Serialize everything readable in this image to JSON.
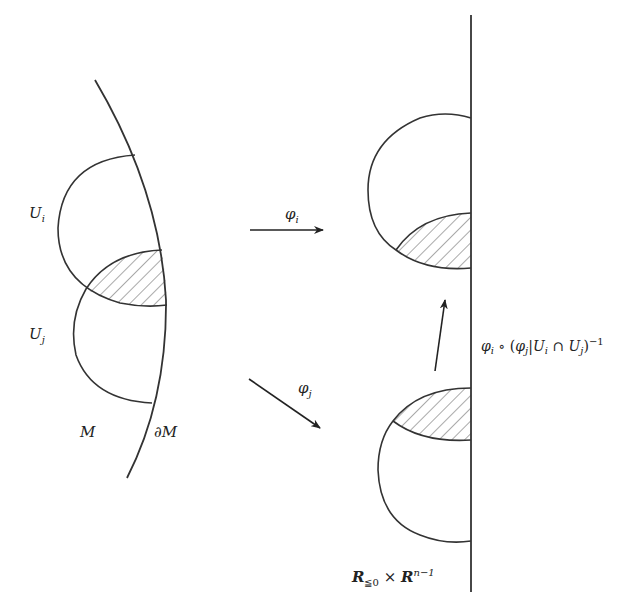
{
  "diagram": {
    "type": "manifold-boundary-charts",
    "colors": {
      "stroke": "#333333",
      "hatch": "#555555",
      "background": "#ffffff"
    },
    "left": {
      "region_label": "M",
      "boundary_label": "∂M",
      "charts": [
        {
          "name": "U",
          "sub": "i"
        },
        {
          "name": "U",
          "sub": "j"
        }
      ],
      "overlap": "hatched"
    },
    "maps": [
      {
        "name": "φ",
        "sub": "i",
        "direction": "right"
      },
      {
        "name": "φ",
        "sub": "j",
        "direction": "down-right"
      }
    ],
    "transition": {
      "label_parts": [
        "φ",
        "i",
        " ∘ (",
        "φ",
        "j",
        "|",
        "U",
        "i",
        " ∩ ",
        "U",
        "j",
        ")",
        "−1"
      ]
    },
    "right": {
      "halfspace_label": {
        "R": "R",
        "sub": "≦0",
        "times": "×",
        "R2": "R",
        "sup": "n−1"
      }
    }
  }
}
